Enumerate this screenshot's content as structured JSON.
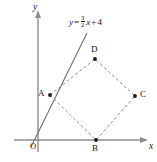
{
  "figure": {
    "type": "coordinate-geometry-diagram",
    "axes": {
      "x_label": "x",
      "y_label": "y",
      "origin_label": "O"
    },
    "equation": {
      "lhs": "y",
      "equals": "=",
      "fraction_numerator": "3",
      "fraction_denominator": "2",
      "variable": "x",
      "plus": "+",
      "constant": "4",
      "full_text": "y = 3/2 x + 4"
    },
    "vertices": [
      {
        "label": "A",
        "cx": 50,
        "cy": 95,
        "label_x": 38,
        "label_y": 90
      },
      {
        "label": "B",
        "cx": 96,
        "cy": 140,
        "label_x": 92,
        "label_y": 143
      },
      {
        "label": "C",
        "cx": 135,
        "cy": 96,
        "label_x": 140,
        "label_y": 91
      },
      {
        "label": "D",
        "cx": 95,
        "cy": 59,
        "label_x": 91,
        "label_y": 45
      }
    ],
    "shape": {
      "name": "quadrilateral-ABCD",
      "edge_style": "dashed",
      "path": "M 50 95 L 95 59 L 135 96 L 96 140 Z"
    },
    "line": {
      "name": "function-line",
      "x1": 31,
      "y1": 147,
      "x2": 87,
      "y2": 33
    },
    "colors": {
      "axis": "#8c8c8c",
      "function_line": "#6e6e6e",
      "dashed_edges": "#8a8a8a",
      "vertex_dot": "#1a1a1a",
      "text": "#141414",
      "background": "#ffffff"
    }
  }
}
